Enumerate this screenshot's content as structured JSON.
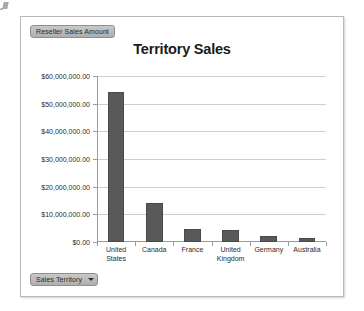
{
  "legend_field": {
    "label": "Reseller Sales Amount",
    "name": "reseller-sales-amount"
  },
  "category_field": {
    "label": "Sales Territory",
    "name": "sales-territory",
    "caret": "chevron-down-icon"
  },
  "colors": {
    "bar": "#595959",
    "bar_border": "#4a4a4a",
    "gridline": "#cfcfcf",
    "axis": "#9b9b9b",
    "frame_border": "#b9b9b9",
    "badge_top": "#c9c9c9",
    "badge_bottom": "#aeaeae",
    "text": "#2b2b2b"
  },
  "chart_data": {
    "type": "bar",
    "title": "Territory Sales",
    "xlabel": "",
    "ylabel": "",
    "series_name": "Reseller Sales Amount",
    "categories": [
      "United States",
      "Canada",
      "France",
      "United Kingdom",
      "Germany",
      "Australia"
    ],
    "category_lines": [
      [
        "United",
        "States"
      ],
      [
        "Canada"
      ],
      [
        "France"
      ],
      [
        "United",
        "Kingdom"
      ],
      [
        "Germany"
      ],
      [
        "Australia"
      ]
    ],
    "values": [
      54100000,
      14000000,
      4700000,
      4300000,
      2000000,
      1500000
    ],
    "ylim": [
      0,
      60000000
    ],
    "ytick_values": [
      60000000,
      50000000,
      40000000,
      30000000,
      20000000,
      10000000,
      0
    ],
    "ytick_labels": [
      "$60,000,000.00",
      "$50,000,000.00",
      "$40,000,000.00",
      "$30,000,000.00",
      "$20,000,000.00",
      "$10,000,000.00",
      "$0.00"
    ],
    "grid": true,
    "legend": false
  }
}
